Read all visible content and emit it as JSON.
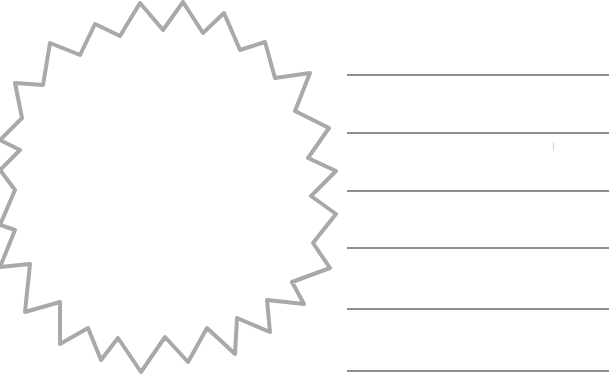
{
  "worksheet": {
    "badge": {
      "shape": "starburst-outline",
      "stroke_color": "#a9a9a9",
      "fill_color": "#ffffff",
      "points": [
        [
          140,
          3
        ],
        [
          163,
          30
        ],
        [
          183,
          2
        ],
        [
          203,
          33
        ],
        [
          224,
          13
        ],
        [
          240,
          50
        ],
        [
          265,
          42
        ],
        [
          275,
          78
        ],
        [
          310,
          73
        ],
        [
          295,
          111
        ],
        [
          329,
          128
        ],
        [
          308,
          158
        ],
        [
          336,
          171
        ],
        [
          311,
          196
        ],
        [
          336,
          214
        ],
        [
          313,
          243
        ],
        [
          330,
          268
        ],
        [
          292,
          282
        ],
        [
          304,
          304
        ],
        [
          267,
          300
        ],
        [
          270,
          332
        ],
        [
          237,
          318
        ],
        [
          235,
          354
        ],
        [
          207,
          328
        ],
        [
          188,
          362
        ],
        [
          165,
          337
        ],
        [
          141,
          372
        ],
        [
          118,
          338
        ],
        [
          101,
          360
        ],
        [
          88,
          328
        ],
        [
          60,
          344
        ],
        [
          60,
          302
        ],
        [
          25,
          312
        ],
        [
          30,
          264
        ],
        [
          0,
          267
        ],
        [
          15,
          230
        ],
        [
          0,
          225
        ],
        [
          15,
          190
        ],
        [
          0,
          170
        ],
        [
          20,
          150
        ],
        [
          0,
          140
        ],
        [
          22,
          118
        ],
        [
          15,
          83
        ],
        [
          43,
          85
        ],
        [
          50,
          43
        ],
        [
          80,
          55
        ],
        [
          95,
          24
        ],
        [
          120,
          36
        ]
      ]
    },
    "lines": [
      {
        "y": 74
      },
      {
        "y": 132
      },
      {
        "y": 190
      },
      {
        "y": 247
      },
      {
        "y": 308
      },
      {
        "y": 370
      }
    ],
    "line_color": "#8e8e8e"
  }
}
